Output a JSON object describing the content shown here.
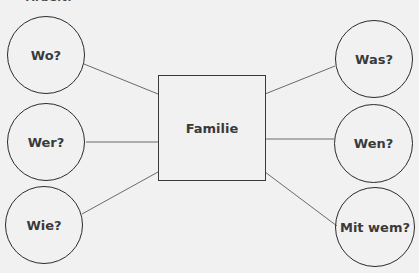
{
  "header": {
    "cut_off_text": "Arbeit:"
  },
  "center": {
    "label": "Familie"
  },
  "nodes": [
    {
      "id": "wo",
      "label": "Wo?",
      "side": "left",
      "cx": 46,
      "cy": 55,
      "r": 39
    },
    {
      "id": "wer",
      "label": "Wer?",
      "side": "left",
      "cx": 46,
      "cy": 142,
      "r": 39
    },
    {
      "id": "wie",
      "label": "Wie?",
      "side": "left",
      "cx": 44,
      "cy": 225,
      "r": 39
    },
    {
      "id": "was",
      "label": "Was?",
      "side": "right",
      "cx": 374,
      "cy": 59,
      "r": 39
    },
    {
      "id": "wen",
      "label": "Wen?",
      "side": "right",
      "cx": 373,
      "cy": 143,
      "r": 39
    },
    {
      "id": "mit-wem",
      "label": "Mit wem?",
      "side": "right",
      "cx": 375,
      "cy": 227,
      "r": 40
    }
  ],
  "colors": {
    "background": "#f1f1f1",
    "stroke": "#2b2b2b",
    "connector": "#6a6a6a",
    "text": "#3a3a3a"
  }
}
